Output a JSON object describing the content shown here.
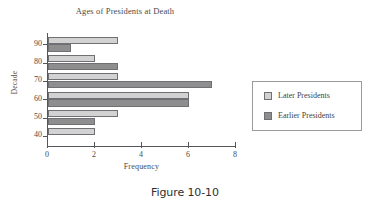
{
  "chart_data": {
    "type": "bar",
    "orientation": "horizontal",
    "title": "Ages of Presidents at Death",
    "xlabel": "Frequency",
    "ylabel": "Decade",
    "categories": [
      "40",
      "50",
      "60",
      "70",
      "80",
      "90"
    ],
    "series": [
      {
        "name": "Later Presidents",
        "values": [
          2,
          3,
          6,
          3,
          2,
          3
        ],
        "color": "#d2d2d2"
      },
      {
        "name": "Earlier Presidents",
        "values": [
          0,
          2,
          6,
          7,
          3,
          1
        ],
        "color": "#8e8e8e"
      }
    ],
    "xlim": [
      0,
      8
    ],
    "xticks": [
      "0",
      "2",
      "4",
      "6",
      "8"
    ],
    "yticks": [
      "40",
      "50",
      "60",
      "70",
      "80",
      "90"
    ],
    "grid": false,
    "legend_position": "right"
  },
  "legend": {
    "items": [
      {
        "label": "Later Presidents"
      },
      {
        "label": "Earlier Presidents"
      }
    ]
  },
  "caption": "Figure 10-10"
}
